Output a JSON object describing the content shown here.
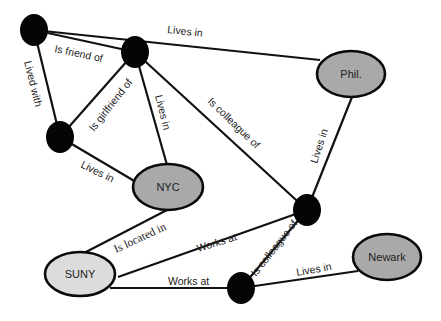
{
  "diagram": {
    "type": "social-network-graph",
    "colors": {
      "edge": "#111111",
      "person_node": "#050505",
      "city_node": "#a9a9a9",
      "institution_node": "#dcdcdc",
      "label_text": "#222222"
    },
    "nodes": [
      {
        "id": "A",
        "kind": "person",
        "label": ""
      },
      {
        "id": "B",
        "kind": "person",
        "label": ""
      },
      {
        "id": "C",
        "kind": "person",
        "label": ""
      },
      {
        "id": "D",
        "kind": "person",
        "label": ""
      },
      {
        "id": "E",
        "kind": "person",
        "label": ""
      },
      {
        "id": "phil",
        "kind": "city",
        "label": "Phil."
      },
      {
        "id": "nyc",
        "kind": "city",
        "label": "NYC"
      },
      {
        "id": "suny",
        "kind": "institution",
        "label": "SUNY"
      },
      {
        "id": "newark",
        "kind": "city",
        "label": "Newark"
      }
    ],
    "edges": [
      {
        "from": "A",
        "to": "B",
        "label": "Is friend of"
      },
      {
        "from": "A",
        "to": "phil",
        "label": "Lives in"
      },
      {
        "from": "A",
        "to": "C",
        "label": "Lived with"
      },
      {
        "from": "B",
        "to": "C",
        "label": "Is girlfriend of"
      },
      {
        "from": "B",
        "to": "nyc",
        "label": "Lives in"
      },
      {
        "from": "B",
        "to": "D",
        "label": "Is colleague of"
      },
      {
        "from": "C",
        "to": "nyc",
        "label": "Lives in"
      },
      {
        "from": "phil",
        "to": "D",
        "label": "Lives in"
      },
      {
        "from": "suny",
        "to": "nyc",
        "label": "Is located in"
      },
      {
        "from": "suny",
        "to": "D",
        "label": "Works at"
      },
      {
        "from": "suny",
        "to": "E",
        "label": "Works at"
      },
      {
        "from": "D",
        "to": "E",
        "label": "Is colleague of"
      },
      {
        "from": "E",
        "to": "newark",
        "label": "Lives in"
      }
    ]
  }
}
